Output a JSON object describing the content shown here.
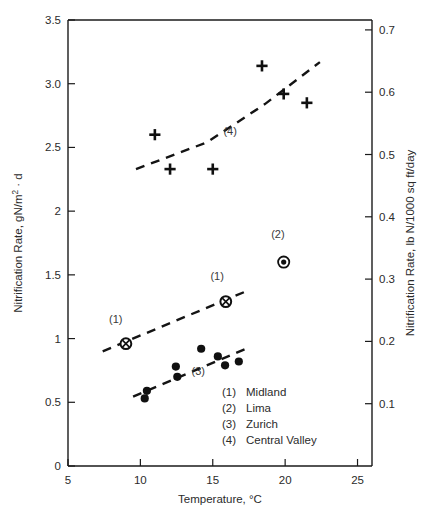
{
  "chart_data": {
    "type": "scatter",
    "title": "",
    "xlabel": "Temperature, °C",
    "ylabel": "Nitrification Rate, gN/m² · d",
    "y2label": "Nitrification Rate, lb N/1000 sq ft/day",
    "xlim": [
      5,
      26
    ],
    "ylim": [
      0,
      3.5
    ],
    "y2lim": [
      0,
      0.7159
    ],
    "grid": false,
    "legend_position": "inside-lower-right",
    "xticks": [
      5,
      10,
      15,
      20,
      25
    ],
    "xtick_labels": [
      "5",
      "10",
      "15",
      "20",
      "25"
    ],
    "yticks": [
      0,
      0.5,
      1,
      1.5,
      2,
      2.5,
      3.0,
      3.5
    ],
    "ytick_labels": [
      "0",
      "0.5",
      "1",
      "1.5",
      "2",
      "2.5",
      "3.0",
      "3.5"
    ],
    "y2ticks": [
      0.1,
      0.2,
      0.3,
      0.4,
      0.5,
      0.6,
      0.7
    ],
    "y2tick_labels": [
      "0.1",
      "0.2",
      "0.3",
      "0.4",
      "0.5",
      "0.6",
      "0.7"
    ],
    "series": [
      {
        "key": "midland",
        "number": "1",
        "name": "Midland",
        "marker": "circle-cross",
        "points": [
          {
            "x": 9.0,
            "y": 0.96
          },
          {
            "x": 15.9,
            "y": 1.29
          }
        ],
        "trend": [
          {
            "x": 7.4,
            "y": 0.9
          },
          {
            "x": 17.5,
            "y": 1.38
          }
        ],
        "annotations": [
          {
            "text": "(1)",
            "x": 8.3,
            "y": 1.12
          },
          {
            "text": "(1)",
            "x": 15.3,
            "y": 1.46
          }
        ]
      },
      {
        "key": "lima",
        "number": "2",
        "name": "Lima",
        "marker": "bullseye",
        "points": [
          {
            "x": 19.9,
            "y": 1.6
          }
        ],
        "trend": null,
        "annotations": [
          {
            "text": "(2)",
            "x": 19.5,
            "y": 1.79
          }
        ]
      },
      {
        "key": "zurich",
        "number": "3",
        "name": "Zurich",
        "marker": "filled-circle",
        "points": [
          {
            "x": 10.3,
            "y": 0.53
          },
          {
            "x": 10.45,
            "y": 0.59
          },
          {
            "x": 12.45,
            "y": 0.78
          },
          {
            "x": 12.55,
            "y": 0.7
          },
          {
            "x": 14.2,
            "y": 0.92
          },
          {
            "x": 15.35,
            "y": 0.86
          },
          {
            "x": 15.85,
            "y": 0.79
          },
          {
            "x": 16.8,
            "y": 0.82
          }
        ],
        "trend": [
          {
            "x": 9.5,
            "y": 0.545
          },
          {
            "x": 17.6,
            "y": 0.935
          }
        ],
        "annotations": [
          {
            "text": "(3)",
            "x": 14.0,
            "y": 0.715
          }
        ]
      },
      {
        "key": "central-valley",
        "number": "4",
        "name": "Central Valley",
        "marker": "plus",
        "points": [
          {
            "x": 11.0,
            "y": 2.6
          },
          {
            "x": 12.05,
            "y": 2.33
          },
          {
            "x": 15.0,
            "y": 2.33
          },
          {
            "x": 18.4,
            "y": 3.14
          },
          {
            "x": 19.9,
            "y": 2.92
          },
          {
            "x": 21.5,
            "y": 2.85
          }
        ],
        "trend": [
          {
            "x": 9.7,
            "y": 2.33
          },
          {
            "x": 14.6,
            "y": 2.54
          },
          {
            "x": 18.6,
            "y": 2.84
          },
          {
            "x": 22.4,
            "y": 3.17
          }
        ],
        "annotations": [
          {
            "text": "(4)",
            "x": 16.2,
            "y": 2.595
          }
        ]
      }
    ],
    "legend_entries": [
      {
        "tag": "(1)",
        "label": "Midland"
      },
      {
        "tag": "(2)",
        "label": "Lima"
      },
      {
        "tag": "(3)",
        "label": "Zurich"
      },
      {
        "tag": "(4)",
        "label": "Central Valley"
      }
    ]
  }
}
